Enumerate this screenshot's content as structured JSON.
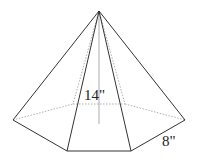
{
  "figure": {
    "type": "hexagonal-pyramid",
    "labels": {
      "height": "14\"",
      "base_edge": "8\""
    },
    "colors": {
      "edge": "#333333",
      "hidden": "#9a9a9a",
      "background": "#ffffff"
    }
  }
}
